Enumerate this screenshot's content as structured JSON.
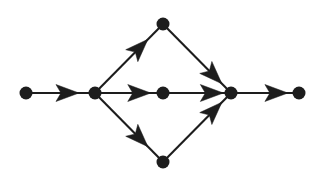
{
  "diagram": {
    "background_color": "#ffffff",
    "node_color": "#1d1d1d",
    "edge_color": "#1d1d1d",
    "node_radius": 6.5,
    "nodes": [
      {
        "id": "n1",
        "label": "source-node",
        "x": 26,
        "y": 93
      },
      {
        "id": "n2",
        "label": "branch-node",
        "x": 95,
        "y": 93
      },
      {
        "id": "n3",
        "label": "top-node",
        "x": 163,
        "y": 24
      },
      {
        "id": "n4",
        "label": "middle-node",
        "x": 163,
        "y": 93
      },
      {
        "id": "n5",
        "label": "bottom-node",
        "x": 163,
        "y": 162
      },
      {
        "id": "n6",
        "label": "merge-node",
        "x": 231,
        "y": 93
      },
      {
        "id": "n7",
        "label": "sink-node",
        "x": 299,
        "y": 93
      }
    ],
    "edges": [
      {
        "id": "e1",
        "label": "source-to-branch",
        "from": "n1",
        "to": "n2",
        "arrow_t": 0.62
      },
      {
        "id": "e2",
        "label": "branch-to-top",
        "from": "n2",
        "to": "n3",
        "arrow_t": 0.68
      },
      {
        "id": "e3",
        "label": "branch-to-middle",
        "from": "n2",
        "to": "n4",
        "arrow_t": 0.68
      },
      {
        "id": "e4",
        "label": "branch-to-bottom",
        "from": "n2",
        "to": "n5",
        "arrow_t": 0.68
      },
      {
        "id": "e5",
        "label": "top-to-merge",
        "from": "n3",
        "to": "n6",
        "arrow_t": 0.78
      },
      {
        "id": "e6",
        "label": "middle-to-merge",
        "from": "n4",
        "to": "n6",
        "arrow_t": 0.76
      },
      {
        "id": "e7",
        "label": "bottom-to-merge",
        "from": "n5",
        "to": "n6",
        "arrow_t": 0.78
      },
      {
        "id": "e8",
        "label": "merge-to-sink",
        "from": "n6",
        "to": "n7",
        "arrow_t": 0.7
      }
    ],
    "arrow": {
      "length": 23,
      "half_width": 8.5,
      "notch": 5
    }
  }
}
